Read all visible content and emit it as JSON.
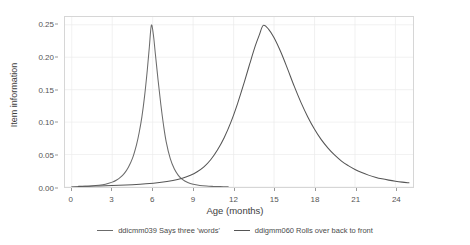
{
  "chart_data": {
    "type": "line",
    "title": "",
    "xlabel": "Age (months)",
    "ylabel": "Item information",
    "xlim": [
      -0.5,
      25.3
    ],
    "ylim": [
      0,
      0.262
    ],
    "grid": true,
    "legend_position": "bottom",
    "xticks": [
      0,
      3,
      6,
      9,
      12,
      15,
      18,
      21,
      24
    ],
    "xticklabels": [
      "0",
      "3",
      "6",
      "9",
      "12",
      "15",
      "18",
      "21",
      "24"
    ],
    "yticks": [
      0.0,
      0.05,
      0.1,
      0.15,
      0.2,
      0.25
    ],
    "yticklabels": [
      "0.00",
      "0.05",
      "0.10",
      "0.15",
      "0.20",
      "0.25"
    ],
    "series": [
      {
        "name": "ddicmm039 Says three 'words'",
        "color": "#6b6b6b",
        "peak_x": 5.9,
        "peak_y": 0.25,
        "points": [
          [
            0.0,
            0.0005
          ],
          [
            0.5,
            0.0007
          ],
          [
            1.0,
            0.0011
          ],
          [
            1.5,
            0.0017
          ],
          [
            2.0,
            0.0027
          ],
          [
            2.5,
            0.0044
          ],
          [
            3.0,
            0.0075
          ],
          [
            3.3,
            0.0105
          ],
          [
            3.6,
            0.0148
          ],
          [
            3.9,
            0.021
          ],
          [
            4.2,
            0.0305
          ],
          [
            4.5,
            0.044
          ],
          [
            4.8,
            0.065
          ],
          [
            5.0,
            0.084
          ],
          [
            5.2,
            0.108
          ],
          [
            5.4,
            0.14
          ],
          [
            5.6,
            0.18
          ],
          [
            5.75,
            0.215
          ],
          [
            5.9,
            0.249
          ],
          [
            6.05,
            0.235
          ],
          [
            6.2,
            0.205
          ],
          [
            6.4,
            0.165
          ],
          [
            6.6,
            0.128
          ],
          [
            6.8,
            0.096
          ],
          [
            7.0,
            0.07
          ],
          [
            7.3,
            0.044
          ],
          [
            7.6,
            0.028
          ],
          [
            7.9,
            0.018
          ],
          [
            8.2,
            0.0118
          ],
          [
            8.6,
            0.007
          ],
          [
            9.0,
            0.0042
          ],
          [
            9.5,
            0.0024
          ],
          [
            10.0,
            0.0014
          ],
          [
            10.5,
            0.0009
          ],
          [
            11.0,
            0.0006
          ],
          [
            11.6,
            0.0004
          ]
        ]
      },
      {
        "name": "ddigmm060 Rolls over back to front",
        "color": "#555555",
        "peak_x": 14.2,
        "peak_y": 0.25,
        "points": [
          [
            0.5,
            0.001
          ],
          [
            1.5,
            0.0014
          ],
          [
            2.5,
            0.0019
          ],
          [
            3.5,
            0.0026
          ],
          [
            4.5,
            0.0036
          ],
          [
            5.5,
            0.005
          ],
          [
            6.5,
            0.007
          ],
          [
            7.5,
            0.01
          ],
          [
            8.2,
            0.0135
          ],
          [
            8.8,
            0.018
          ],
          [
            9.3,
            0.0235
          ],
          [
            9.8,
            0.031
          ],
          [
            10.3,
            0.042
          ],
          [
            10.8,
            0.057
          ],
          [
            11.3,
            0.076
          ],
          [
            11.8,
            0.1
          ],
          [
            12.3,
            0.129
          ],
          [
            12.8,
            0.162
          ],
          [
            13.2,
            0.19
          ],
          [
            13.6,
            0.217
          ],
          [
            13.9,
            0.234
          ],
          [
            14.2,
            0.249
          ],
          [
            14.6,
            0.243
          ],
          [
            15.0,
            0.23
          ],
          [
            15.5,
            0.208
          ],
          [
            16.0,
            0.182
          ],
          [
            16.5,
            0.155
          ],
          [
            17.0,
            0.13
          ],
          [
            17.5,
            0.108
          ],
          [
            18.0,
            0.089
          ],
          [
            18.5,
            0.073
          ],
          [
            19.0,
            0.06
          ],
          [
            19.5,
            0.049
          ],
          [
            20.0,
            0.04
          ],
          [
            20.5,
            0.033
          ],
          [
            21.0,
            0.027
          ],
          [
            21.5,
            0.0222
          ],
          [
            22.0,
            0.0183
          ],
          [
            22.5,
            0.0152
          ],
          [
            23.0,
            0.0126
          ],
          [
            23.5,
            0.0106
          ],
          [
            24.0,
            0.0089
          ],
          [
            24.5,
            0.0075
          ],
          [
            25.0,
            0.0064
          ]
        ]
      }
    ]
  }
}
